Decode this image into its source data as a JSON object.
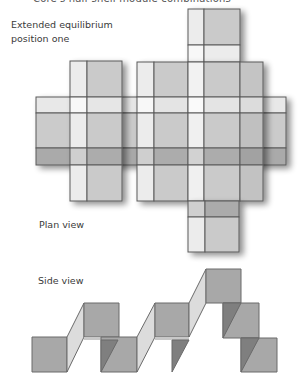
{
  "header": {
    "clipped_title": "Core's half-shell module combinations"
  },
  "figure": {
    "title_line1": "Extended equilibrium",
    "title_line2": "position one",
    "plan_view_label": "Plan view",
    "side_view_label": "Side view"
  },
  "colors": {
    "outline": "#5a5a5a",
    "cell_white": "#f7f7f7",
    "cell_light": "#e6e6e6",
    "cell_mid": "#cacaca",
    "cell_dark": "#a9a9a9",
    "side_square": "#a6a6a6",
    "side_fold_light": "#dcdcdc",
    "side_fold_dark": "#7f7f7f"
  }
}
